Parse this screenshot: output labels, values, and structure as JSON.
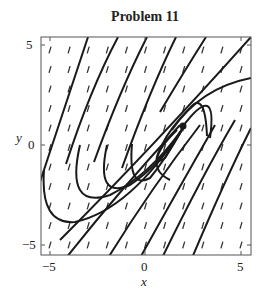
{
  "chart_data": {
    "type": "line",
    "subtype": "phase-portrait",
    "title": "Problem 11",
    "xlabel": "x",
    "ylabel": "y",
    "xlim": [
      -5.5,
      5.5
    ],
    "ylim": [
      -5.5,
      5.5
    ],
    "xticks": [
      -5,
      0,
      5
    ],
    "yticks": [
      -5,
      0,
      5
    ],
    "grid": false,
    "legend": null,
    "direction_field": true,
    "equilibrium_region": {
      "x": 2.0,
      "y": 1.0
    },
    "trajectories_count": 13
  },
  "labels": {
    "title": "Problem 11",
    "xlabel": "x",
    "ylabel": "y",
    "xtick_neg5": "−5",
    "xtick_0": "0",
    "xtick_5": "5",
    "ytick_5": "5",
    "ytick_0": "0",
    "ytick_neg5": "−5"
  }
}
